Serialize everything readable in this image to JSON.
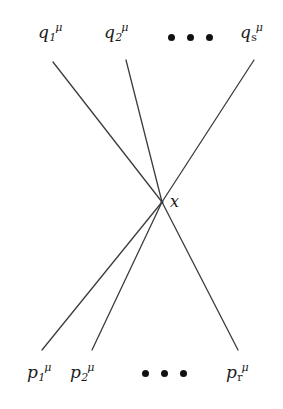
{
  "figure": {
    "type": "feynman-vertex-diagram",
    "background_color": "#ffffff",
    "line_color": "#3c3c3c",
    "text_color": "#1a1a1a",
    "vertex": {
      "label": "x",
      "x": 162,
      "y": 202
    },
    "incoming_label_prefix": "q",
    "outgoing_label_prefix": "p",
    "superscript": "μ"
  },
  "top_labels": [
    {
      "base": "q",
      "sub": "1",
      "sup": "μ",
      "x": 38,
      "y": 22,
      "sub_style": "italic"
    },
    {
      "base": "q",
      "sub": "2",
      "sup": "μ",
      "x": 104,
      "y": 22,
      "sub_style": "italic"
    },
    {
      "base": "q",
      "sub": "s",
      "sup": "μ",
      "x": 240,
      "y": 22,
      "sub_style": "roman"
    }
  ],
  "bottom_labels": [
    {
      "base": "p",
      "sub": "1",
      "sup": "μ",
      "x": 27,
      "y": 362,
      "sub_style": "italic"
    },
    {
      "base": "p",
      "sub": "2",
      "sup": "μ",
      "x": 70,
      "y": 362,
      "sub_style": "italic"
    },
    {
      "base": "p",
      "sub": "r",
      "sup": "μ",
      "x": 226,
      "y": 362,
      "sub_style": "roman"
    }
  ],
  "ellipses": [
    {
      "name": "top-ellipsis",
      "x": 168,
      "y": 34,
      "dots": 3
    },
    {
      "name": "bottom-ellipsis",
      "x": 142,
      "y": 370,
      "dots": 3
    }
  ],
  "lines": [
    {
      "name": "line-q1",
      "x1": 53,
      "y1": 62,
      "x2": 162,
      "y2": 202
    },
    {
      "name": "line-q2",
      "x1": 126,
      "y1": 60,
      "x2": 162,
      "y2": 202
    },
    {
      "name": "line-qs",
      "x1": 254,
      "y1": 60,
      "x2": 162,
      "y2": 202
    },
    {
      "name": "line-p1",
      "x1": 162,
      "y1": 202,
      "x2": 42,
      "y2": 350
    },
    {
      "name": "line-p2",
      "x1": 162,
      "y1": 202,
      "x2": 92,
      "y2": 350
    },
    {
      "name": "line-pr",
      "x1": 162,
      "y1": 202,
      "x2": 238,
      "y2": 350
    }
  ]
}
